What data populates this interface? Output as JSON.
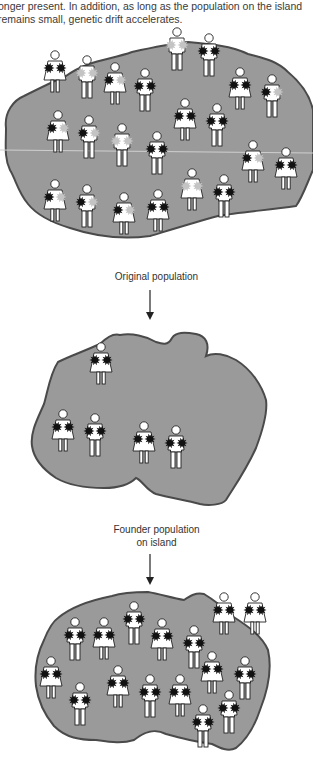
{
  "caption": {
    "line1": "onger present. In addition, as long as the population on the island",
    "line2": "remains small, genetic drift accelerates."
  },
  "labels": {
    "original": "Original population",
    "founder_line1": "Founder population",
    "founder_line2": "on island"
  },
  "colors": {
    "island_fill": "#9a9a9a",
    "island_edge": "#4a4a4a",
    "dark_allele": "#111111",
    "light_allele": "#c4c4c4",
    "figure_fill": "#ffffff",
    "figure_stroke": "#222222"
  },
  "populations": [
    {
      "name": "original",
      "figures": [
        {
          "x": 55,
          "y": 55,
          "g": "f",
          "a": [
            "d",
            "d"
          ]
        },
        {
          "x": 87,
          "y": 60,
          "g": "m",
          "a": [
            "l",
            "l"
          ]
        },
        {
          "x": 115,
          "y": 67,
          "g": "f",
          "a": [
            "d",
            "l"
          ]
        },
        {
          "x": 145,
          "y": 73,
          "g": "m",
          "a": [
            "d",
            "d"
          ]
        },
        {
          "x": 177,
          "y": 32,
          "g": "m",
          "a": [
            "l",
            "l"
          ]
        },
        {
          "x": 209,
          "y": 38,
          "g": "m",
          "a": [
            "d",
            "d"
          ]
        },
        {
          "x": 240,
          "y": 72,
          "g": "f",
          "a": [
            "d",
            "d"
          ]
        },
        {
          "x": 272,
          "y": 79,
          "g": "m",
          "a": [
            "d",
            "l"
          ]
        },
        {
          "x": 58,
          "y": 115,
          "g": "f",
          "a": [
            "d",
            "l"
          ]
        },
        {
          "x": 89,
          "y": 120,
          "g": "m",
          "a": [
            "d",
            "l"
          ]
        },
        {
          "x": 122,
          "y": 128,
          "g": "m",
          "a": [
            "l",
            "l"
          ]
        },
        {
          "x": 157,
          "y": 136,
          "g": "m",
          "a": [
            "d",
            "d"
          ]
        },
        {
          "x": 185,
          "y": 103,
          "g": "f",
          "a": [
            "d",
            "d"
          ]
        },
        {
          "x": 217,
          "y": 108,
          "g": "m",
          "a": [
            "d",
            "d"
          ]
        },
        {
          "x": 253,
          "y": 145,
          "g": "f",
          "a": [
            "d",
            "l"
          ]
        },
        {
          "x": 286,
          "y": 152,
          "g": "f",
          "a": [
            "d",
            "d"
          ]
        },
        {
          "x": 55,
          "y": 184,
          "g": "f",
          "a": [
            "d",
            "l"
          ]
        },
        {
          "x": 87,
          "y": 189,
          "g": "m",
          "a": [
            "d",
            "l"
          ]
        },
        {
          "x": 124,
          "y": 197,
          "g": "f",
          "a": [
            "d",
            "l"
          ]
        },
        {
          "x": 158,
          "y": 194,
          "g": "f",
          "a": [
            "d",
            "d"
          ]
        },
        {
          "x": 192,
          "y": 173,
          "g": "f",
          "a": [
            "l",
            "l"
          ]
        },
        {
          "x": 224,
          "y": 179,
          "g": "m",
          "a": [
            "d",
            "d"
          ]
        }
      ]
    },
    {
      "name": "founder",
      "figures": [
        {
          "x": 101,
          "y": 347,
          "g": "f",
          "a": [
            "d",
            "d"
          ]
        },
        {
          "x": 63,
          "y": 414,
          "g": "f",
          "a": [
            "d",
            "d"
          ]
        },
        {
          "x": 95,
          "y": 418,
          "g": "m",
          "a": [
            "d",
            "d"
          ]
        },
        {
          "x": 144,
          "y": 426,
          "g": "f",
          "a": [
            "d",
            "d"
          ]
        },
        {
          "x": 176,
          "y": 430,
          "g": "m",
          "a": [
            "d",
            "d"
          ]
        }
      ]
    },
    {
      "name": "descendant",
      "figures": [
        {
          "x": 224,
          "y": 597,
          "g": "f",
          "a": [
            "d",
            "d"
          ]
        },
        {
          "x": 255,
          "y": 597,
          "g": "f",
          "a": [
            "d",
            "d"
          ]
        },
        {
          "x": 134,
          "y": 606,
          "g": "m",
          "a": [
            "d",
            "d"
          ]
        },
        {
          "x": 75,
          "y": 622,
          "g": "m",
          "a": [
            "d",
            "d"
          ]
        },
        {
          "x": 104,
          "y": 622,
          "g": "f",
          "a": [
            "d",
            "d"
          ]
        },
        {
          "x": 162,
          "y": 623,
          "g": "f",
          "a": [
            "d",
            "d"
          ]
        },
        {
          "x": 194,
          "y": 630,
          "g": "m",
          "a": [
            "d",
            "d"
          ]
        },
        {
          "x": 51,
          "y": 661,
          "g": "f",
          "a": [
            "d",
            "d"
          ]
        },
        {
          "x": 212,
          "y": 656,
          "g": "f",
          "a": [
            "d",
            "d"
          ]
        },
        {
          "x": 245,
          "y": 661,
          "g": "m",
          "a": [
            "d",
            "d"
          ]
        },
        {
          "x": 118,
          "y": 670,
          "g": "f",
          "a": [
            "d",
            "d"
          ]
        },
        {
          "x": 80,
          "y": 687,
          "g": "m",
          "a": [
            "d",
            "d"
          ]
        },
        {
          "x": 150,
          "y": 679,
          "g": "m",
          "a": [
            "d",
            "d"
          ]
        },
        {
          "x": 180,
          "y": 679,
          "g": "f",
          "a": [
            "d",
            "d"
          ]
        },
        {
          "x": 229,
          "y": 695,
          "g": "m",
          "a": [
            "d",
            "d"
          ]
        },
        {
          "x": 203,
          "y": 709,
          "g": "m",
          "a": [
            "d",
            "d"
          ]
        }
      ]
    }
  ]
}
